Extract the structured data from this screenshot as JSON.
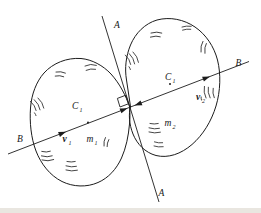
{
  "colors": {
    "ink": "#1c1c1c",
    "paper": "#ffffff"
  },
  "diagram": {
    "tangent_line": {
      "top_label": "A",
      "bottom_label": "A"
    },
    "impact_line": {
      "left_label": "B",
      "right_label": "B"
    },
    "body_left": {
      "center": {
        "base": "C",
        "sub": "1"
      },
      "velocity": {
        "base": "v",
        "sub": "1"
      },
      "mass": {
        "base": "m",
        "sub": "1"
      }
    },
    "body_right": {
      "center": {
        "base": "C",
        "sub": "1"
      },
      "velocity": {
        "base": "v",
        "sub": "2"
      },
      "mass": {
        "base": "m",
        "sub": "2"
      }
    }
  }
}
